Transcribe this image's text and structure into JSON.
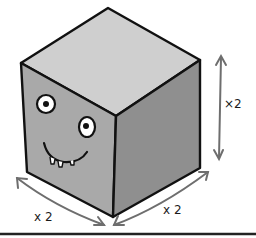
{
  "illustration": {
    "subject": "cube with cartoon face",
    "labels": {
      "height": "×2",
      "left_depth": "x 2",
      "right_width": "x 2"
    },
    "colors": {
      "top_face": "#cfcfcf",
      "left_face": "#a9a9a9",
      "right_face": "#8f8f8f",
      "outline": "#111111",
      "arrow": "#6e6e6e",
      "background": "#ffffff"
    }
  }
}
